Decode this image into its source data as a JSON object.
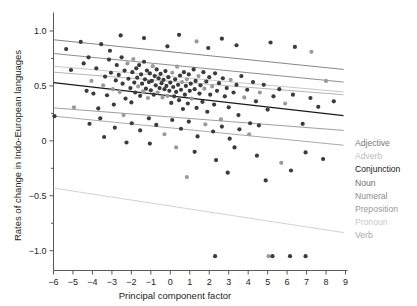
{
  "chart_data": {
    "type": "scatter",
    "title": "",
    "xlabel": "Principal component factor",
    "ylabel": "Rates of change in Indo-European languages",
    "xlim": [
      -6,
      9
    ],
    "ylim": [
      -1.18,
      1.15
    ],
    "xticks": [
      -6,
      -5,
      -4,
      -3,
      -2,
      -1,
      0,
      1,
      2,
      3,
      4,
      5,
      6,
      7,
      8,
      9
    ],
    "xticklabels": [
      "−6",
      "−5",
      "−4",
      "−3",
      "−2",
      "−1",
      "0",
      "1",
      "2",
      "3",
      "4",
      "5",
      "6",
      "7",
      "8",
      "9"
    ],
    "yticks": [
      -1.0,
      -0.5,
      0,
      0.5,
      1.0
    ],
    "yticklabels": [
      "−1.0",
      "−0.5",
      "0",
      "0.5",
      "1.0"
    ],
    "yminorticks": [
      -0.75,
      -0.25,
      0.25,
      0.75
    ],
    "grid": false,
    "legend_position": "right",
    "marker": {
      "size": 2.1,
      "color": "#3b3b3b",
      "color_light": "#9a9a9a"
    },
    "series": [
      {
        "name": "Adjective",
        "color": "#7a7a7a",
        "line": {
          "x0": -6,
          "y0": 0.795,
          "x1": 8.9,
          "y1": 0.535
        }
      },
      {
        "name": "Adverb",
        "color": "#bdbdbd",
        "line": {
          "x0": -6,
          "y0": 0.68,
          "x1": 8.9,
          "y1": 0.445
        }
      },
      {
        "name": "Conjunction",
        "color": "#1a1a1a",
        "line": {
          "x0": -6,
          "y0": 0.53,
          "x1": 8.9,
          "y1": 0.23
        }
      },
      {
        "name": "Noun",
        "color": "#6f6f6f",
        "line": {
          "x0": -6,
          "y0": 0.92,
          "x1": 8.9,
          "y1": 0.65
        }
      },
      {
        "name": "Numeral",
        "color": "#8c8c8c",
        "line": {
          "x0": -6,
          "y0": 0.3,
          "x1": 8.9,
          "y1": 0.095
        }
      },
      {
        "name": "Preposition",
        "color": "#9a9a9a",
        "line": {
          "x0": -6,
          "y0": 0.225,
          "x1": 8.9,
          "y1": -0.04
        }
      },
      {
        "name": "Pronoun",
        "color": "#c9c9c9",
        "line": {
          "x0": -6,
          "y0": -0.43,
          "x1": 8.9,
          "y1": -0.835
        }
      },
      {
        "name": "Verb",
        "color": "#a8a8a8",
        "line": {
          "x0": -6,
          "y0": 0.625,
          "x1": 8.9,
          "y1": 0.42
        }
      }
    ],
    "points": [
      [
        -5.95,
        0.225
      ],
      [
        -5.35,
        0.835
      ],
      [
        -5.1,
        0.645
      ],
      [
        -4.95,
        0.305
      ],
      [
        -4.6,
        0.9
      ],
      [
        -4.45,
        0.705
      ],
      [
        -4.3,
        0.455
      ],
      [
        -4.2,
        0.76
      ],
      [
        -4.05,
        0.545
      ],
      [
        -3.95,
        0.43
      ],
      [
        -3.8,
        0.66
      ],
      [
        -3.7,
        0.295
      ],
      [
        -3.55,
        0.88
      ],
      [
        -3.45,
        0.505
      ],
      [
        -3.35,
        0.585
      ],
      [
        -3.25,
        0.415
      ],
      [
        -3.15,
        0.74
      ],
      [
        -3.05,
        0.62
      ],
      [
        -2.95,
        0.47
      ],
      [
        -2.9,
        0.33
      ],
      [
        -2.8,
        0.55
      ],
      [
        -2.75,
        0.69
      ],
      [
        -2.65,
        0.6
      ],
      [
        -2.6,
        0.445
      ],
      [
        -2.5,
        0.76
      ],
      [
        -2.45,
        0.52
      ],
      [
        -2.35,
        0.64
      ],
      [
        -2.3,
        0.385
      ],
      [
        -2.2,
        0.705
      ],
      [
        -2.15,
        0.565
      ],
      [
        -2.05,
        0.48
      ],
      [
        -2.0,
        0.35
      ],
      [
        -1.95,
        0.625
      ],
      [
        -1.9,
        0.745
      ],
      [
        -1.85,
        0.53
      ],
      [
        -1.8,
        0.44
      ],
      [
        -1.75,
        0.66
      ],
      [
        -1.7,
        0.575
      ],
      [
        -1.65,
        0.495
      ],
      [
        -1.6,
        0.69
      ],
      [
        -1.55,
        0.41
      ],
      [
        -1.5,
        0.605
      ],
      [
        -1.45,
        0.52
      ],
      [
        -1.4,
        0.45
      ],
      [
        -1.35,
        0.72
      ],
      [
        -1.3,
        0.56
      ],
      [
        -1.25,
        0.475
      ],
      [
        -1.2,
        0.64
      ],
      [
        -1.15,
        0.39
      ],
      [
        -1.1,
        0.535
      ],
      [
        -1.05,
        0.615
      ],
      [
        -1.0,
        0.46
      ],
      [
        -0.95,
        0.545
      ],
      [
        -0.9,
        0.68
      ],
      [
        -0.85,
        0.42
      ],
      [
        -0.8,
        0.59
      ],
      [
        -0.75,
        0.505
      ],
      [
        -0.7,
        0.65
      ],
      [
        -0.65,
        0.44
      ],
      [
        -0.6,
        0.57
      ],
      [
        -0.55,
        0.48
      ],
      [
        -0.5,
        0.61
      ],
      [
        -0.45,
        0.525
      ],
      [
        -0.4,
        0.395
      ],
      [
        -0.35,
        0.555
      ],
      [
        -0.3,
        0.47
      ],
      [
        -0.25,
        0.635
      ],
      [
        -0.2,
        0.5
      ],
      [
        -0.15,
        0.41
      ],
      [
        -0.1,
        0.58
      ],
      [
        -0.05,
        0.455
      ],
      [
        0.0,
        0.53
      ],
      [
        0.05,
        0.345
      ],
      [
        0.1,
        0.62
      ],
      [
        0.15,
        0.49
      ],
      [
        0.2,
        0.405
      ],
      [
        0.25,
        0.56
      ],
      [
        0.3,
        0.445
      ],
      [
        0.35,
        0.675
      ],
      [
        0.4,
        0.51
      ],
      [
        0.45,
        0.37
      ],
      [
        0.5,
        0.595
      ],
      [
        0.55,
        0.465
      ],
      [
        0.6,
        0.535
      ],
      [
        0.65,
        0.29
      ],
      [
        0.7,
        0.625
      ],
      [
        0.75,
        0.42
      ],
      [
        0.8,
        0.5
      ],
      [
        0.85,
        0.56
      ],
      [
        0.9,
        0.34
      ],
      [
        0.95,
        0.605
      ],
      [
        1.0,
        0.455
      ],
      [
        1.05,
        0.52
      ],
      [
        1.1,
        0.385
      ],
      [
        1.2,
        0.65
      ],
      [
        1.25,
        0.47
      ],
      [
        1.3,
        0.545
      ],
      [
        1.35,
        0.3
      ],
      [
        1.45,
        0.59
      ],
      [
        1.5,
        0.43
      ],
      [
        1.55,
        0.505
      ],
      [
        1.65,
        0.355
      ],
      [
        1.7,
        0.625
      ],
      [
        1.75,
        0.475
      ],
      [
        1.85,
        0.54
      ],
      [
        1.9,
        0.265
      ],
      [
        2.0,
        0.58
      ],
      [
        2.05,
        0.42
      ],
      [
        2.15,
        0.495
      ],
      [
        2.25,
        0.33
      ],
      [
        2.3,
        0.615
      ],
      [
        2.4,
        0.455
      ],
      [
        2.5,
        0.525
      ],
      [
        2.6,
        0.195
      ],
      [
        2.7,
        0.57
      ],
      [
        2.8,
        0.405
      ],
      [
        2.9,
        0.48
      ],
      [
        3.0,
        0.305
      ],
      [
        3.1,
        0.555
      ],
      [
        3.25,
        0.44
      ],
      [
        3.4,
        0.51
      ],
      [
        3.5,
        0.235
      ],
      [
        3.65,
        0.59
      ],
      [
        3.8,
        0.395
      ],
      [
        3.95,
        0.465
      ],
      [
        4.1,
        0.16
      ],
      [
        4.25,
        0.535
      ],
      [
        4.4,
        0.36
      ],
      [
        4.6,
        0.44
      ],
      [
        4.8,
        0.51
      ],
      [
        5.0,
        0.285
      ],
      [
        5.3,
        0.405
      ],
      [
        5.6,
        0.47
      ],
      [
        5.9,
        0.34
      ],
      [
        6.3,
        0.42
      ],
      [
        6.8,
        0.155
      ],
      [
        7.2,
        0.39
      ],
      [
        7.6,
        0.31
      ],
      [
        8.0,
        0.545
      ],
      [
        8.4,
        0.36
      ],
      [
        -4.15,
        0.155
      ],
      [
        -3.6,
        0.205
      ],
      [
        -2.85,
        0.12
      ],
      [
        -2.4,
        0.235
      ],
      [
        -1.98,
        0.16
      ],
      [
        -1.55,
        0.095
      ],
      [
        -1.1,
        0.205
      ],
      [
        -0.72,
        0.145
      ],
      [
        -0.3,
        0.06
      ],
      [
        0.1,
        0.19
      ],
      [
        0.55,
        0.11
      ],
      [
        0.95,
        0.175
      ],
      [
        1.4,
        0.04
      ],
      [
        1.8,
        0.15
      ],
      [
        2.2,
        0.085
      ],
      [
        2.65,
        0.13
      ],
      [
        3.05,
        0.02
      ],
      [
        3.55,
        0.105
      ],
      [
        4.05,
        0.06
      ],
      [
        4.55,
        0.14
      ],
      [
        -2.55,
        0.96
      ],
      [
        -1.35,
        0.935
      ],
      [
        0.45,
        0.965
      ],
      [
        1.35,
        0.905
      ],
      [
        2.65,
        0.93
      ],
      [
        3.4,
        0.87
      ],
      [
        5.15,
        0.895
      ],
      [
        6.4,
        0.855
      ],
      [
        7.25,
        0.81
      ],
      [
        -0.15,
        0.86
      ],
      [
        -3.1,
        0.82
      ],
      [
        1.95,
        0.845
      ],
      [
        -1.05,
        -0.025
      ],
      [
        0.3,
        -0.06
      ],
      [
        1.25,
        -0.1
      ],
      [
        2.35,
        -0.175
      ],
      [
        3.3,
        -0.06
      ],
      [
        4.45,
        -0.135
      ],
      [
        5.7,
        -0.2
      ],
      [
        6.95,
        -0.105
      ],
      [
        7.85,
        -0.165
      ],
      [
        -2.25,
        -0.015
      ],
      [
        -3.4,
        0.035
      ],
      [
        0.85,
        -0.33
      ],
      [
        2.95,
        -0.29
      ],
      [
        4.9,
        -0.36
      ],
      [
        6.2,
        -0.27
      ],
      [
        2.3,
        -1.05
      ],
      [
        5.05,
        -1.05
      ],
      [
        5.25,
        -1.05
      ],
      [
        6.15,
        -1.05
      ],
      [
        6.95,
        -1.05
      ]
    ]
  },
  "legend": {
    "items": [
      {
        "label": "Adjective",
        "color": "#7a7a7a"
      },
      {
        "label": "Adverb",
        "color": "#bdbdbd"
      },
      {
        "label": "Conjunction",
        "color": "#1a1a1a"
      },
      {
        "label": "Noun",
        "color": "#6f6f6f"
      },
      {
        "label": "Numeral",
        "color": "#8c8c8c"
      },
      {
        "label": "Preposition",
        "color": "#9a9a9a"
      },
      {
        "label": "Pronoun",
        "color": "#c9c9c9"
      },
      {
        "label": "Verb",
        "color": "#a8a8a8"
      }
    ]
  }
}
